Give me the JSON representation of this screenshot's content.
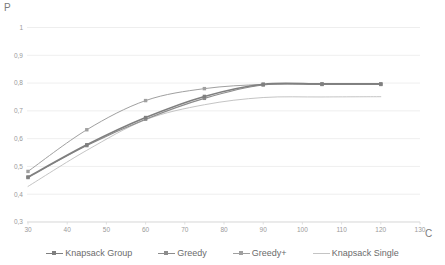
{
  "chart_data": {
    "type": "line",
    "title": "",
    "xlabel": "C",
    "ylabel": "P",
    "xlim": [
      30,
      130
    ],
    "ylim": [
      0.3,
      1.0
    ],
    "grid": true,
    "legend_position": "bottom",
    "xticks": [
      "30",
      "40",
      "50",
      "60",
      "70",
      "80",
      "90",
      "100",
      "110",
      "120",
      "130"
    ],
    "yticks": [
      "0,3",
      "0,4",
      "0,5",
      "0,6",
      "0,7",
      "0,8",
      "0,9",
      "1"
    ],
    "x": [
      30,
      45,
      60,
      75,
      90,
      105,
      120
    ],
    "series": [
      {
        "name": "Knapsack Group",
        "color": "#7f7f7f",
        "marker": "square",
        "width": 1.6,
        "values": [
          0.462,
          0.578,
          0.676,
          0.752,
          0.796,
          0.797,
          0.797
        ]
      },
      {
        "name": "Greedy",
        "color": "#8c8c8c",
        "marker": "square",
        "width": 1.1,
        "values": [
          0.46,
          0.575,
          0.67,
          0.745,
          0.793,
          0.795,
          0.795
        ]
      },
      {
        "name": "Greedy+",
        "color": "#a0a0a0",
        "marker": "square",
        "width": 1.0,
        "values": [
          0.482,
          0.632,
          0.737,
          0.78,
          0.795,
          0.796,
          0.796
        ]
      },
      {
        "name": "Knapsack Single",
        "color": "#bdbdbd",
        "marker": "none",
        "width": 0.9,
        "values": [
          0.428,
          0.558,
          0.668,
          0.722,
          0.748,
          0.75,
          0.751
        ]
      }
    ]
  },
  "axis": {
    "y_title": "P",
    "x_title": "C"
  }
}
